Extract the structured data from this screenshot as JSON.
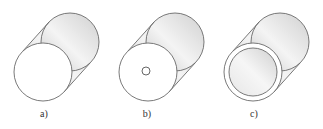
{
  "figure": {
    "panels": [
      {
        "label": "a)",
        "description": "solid cylinder"
      },
      {
        "label": "b)",
        "description": "cylinder with small central hole"
      },
      {
        "label": "c)",
        "description": "hollow tube"
      }
    ],
    "colors": {
      "stroke": "#6a6a6a",
      "face": "#ffffff",
      "shade": "#d8d8d8"
    }
  }
}
